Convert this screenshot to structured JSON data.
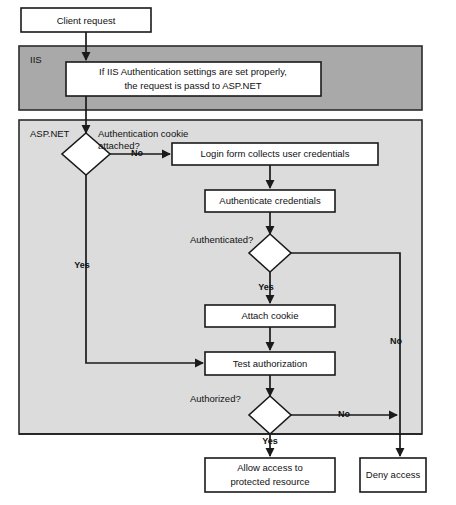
{
  "diagram": {
    "colors": {
      "iis_container_fill": "#a9a9a9",
      "aspnet_container_fill": "#dcdcdc",
      "node_fill": "#ffffff",
      "stroke": "#1a1a1a",
      "page_background": "#ffffff"
    },
    "containers": [
      {
        "id": "iis",
        "label": "IIS"
      },
      {
        "id": "aspnet",
        "label": "ASP.NET"
      }
    ],
    "nodes": [
      {
        "id": "client-request",
        "type": "process",
        "label": "Client request"
      },
      {
        "id": "iis-auth-check",
        "type": "process",
        "label_line1": "If IIS Authentication settings are set properly,",
        "label_line2": "the request is passd to ASP.NET"
      },
      {
        "id": "cookie-attached",
        "type": "decision",
        "label_line1": "Authentication cookie",
        "label_line2": "attached?"
      },
      {
        "id": "login-form",
        "type": "process",
        "label": "Login form collects user credentials"
      },
      {
        "id": "authenticate-credentials",
        "type": "process",
        "label": "Authenticate credentials"
      },
      {
        "id": "authenticated",
        "type": "decision",
        "label": "Authenticated?"
      },
      {
        "id": "attach-cookie",
        "type": "process",
        "label": "Attach cookie"
      },
      {
        "id": "test-authorization",
        "type": "process",
        "label": "Test authorization"
      },
      {
        "id": "authorized",
        "type": "decision",
        "label": "Authorized?"
      },
      {
        "id": "allow-access",
        "type": "process",
        "label_line1": "Allow access to",
        "label_line2": "protected resource"
      },
      {
        "id": "deny-access",
        "type": "process",
        "label": "Deny access"
      }
    ],
    "edge_labels": {
      "cookie_no": "No",
      "cookie_yes": "Yes",
      "authenticated_yes": "Yes",
      "authenticated_no": "No",
      "authorized_yes": "Yes",
      "authorized_no": "No"
    }
  }
}
